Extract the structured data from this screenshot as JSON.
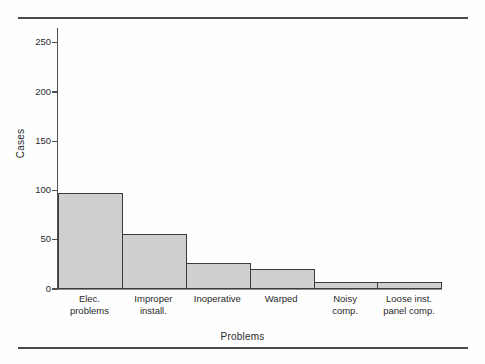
{
  "figure": {
    "page_rules": {
      "top": true,
      "bottom": true
    },
    "caption_text": ""
  },
  "chart_data": {
    "type": "bar",
    "title": "",
    "subtitle": "",
    "xlabel": "Problems",
    "ylabel": "Cases",
    "categories": [
      "Elec. problems",
      "Improper install.",
      "Inoperative",
      "Warped",
      "Noisy comp.",
      "Loose inst. panel comp."
    ],
    "category_lines": [
      [
        "Elec.",
        "problems"
      ],
      [
        "Improper",
        "install."
      ],
      [
        "Inoperative",
        ""
      ],
      [
        "Warped",
        ""
      ],
      [
        "Noisy",
        "comp."
      ],
      [
        "Loose inst.",
        "panel comp."
      ]
    ],
    "values": [
      97,
      56,
      26,
      20,
      7,
      7
    ],
    "ylim": [
      0,
      265
    ],
    "yticks": [
      0,
      50,
      100,
      150,
      200,
      250
    ],
    "ytick_labels": [
      "0",
      "50",
      "100",
      "150",
      "200",
      "250"
    ],
    "grid": false,
    "legend": null,
    "bar_fill_color": "#cfcfcf",
    "bar_edge_color": "#3c3c3c",
    "axis_color": "#4f4f4f",
    "contiguous_bars": true
  }
}
